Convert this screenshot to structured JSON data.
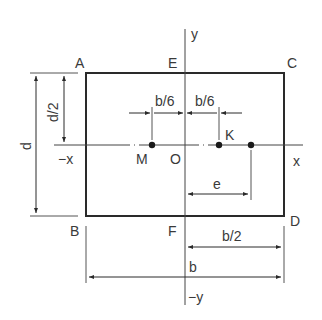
{
  "diagram": {
    "type": "rectangular-section-kern",
    "colors": {
      "line": "#2a2a2a",
      "thin": "#555555",
      "text": "#3a3a3a",
      "background": "#ffffff"
    },
    "corners": {
      "A": "A",
      "C": "C",
      "B": "B",
      "D": "D"
    },
    "axis_points": {
      "E": "E",
      "F": "F",
      "O": "O"
    },
    "axes": {
      "y": "y",
      "neg_y": "−y",
      "x": "x",
      "neg_x": "−x"
    },
    "points": {
      "M": "M",
      "K": "K"
    },
    "dimensions": {
      "d": "d",
      "d_half": "d/2",
      "b_sixth_left": "b/6",
      "b_sixth_right": "b/6",
      "e": "e",
      "b_half": "b/2",
      "b": "b"
    }
  }
}
